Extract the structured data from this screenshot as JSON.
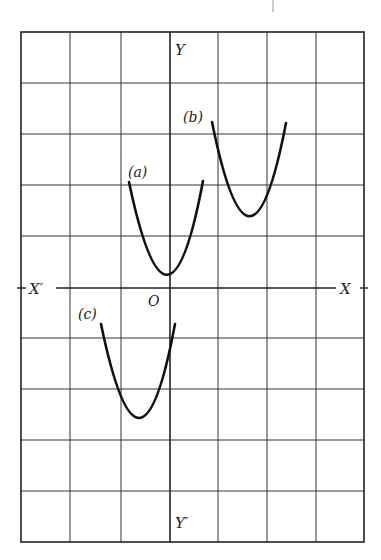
{
  "diagram": {
    "type": "coordinate-grid-with-parabolas",
    "grid": {
      "columns": 7,
      "rows": 10,
      "origin_col": 3,
      "origin_row": 5
    },
    "axes": {
      "x_positive": "X",
      "x_negative": "X′",
      "y_positive": "Y",
      "y_negative": "Y′",
      "origin": "O"
    },
    "curves": [
      {
        "id": "a",
        "label": "(a)",
        "vertex": [
          0,
          0.3
        ],
        "shape": "parabola-up"
      },
      {
        "id": "b",
        "label": "(b)",
        "vertex": [
          1.6,
          1.4
        ],
        "shape": "parabola-up"
      },
      {
        "id": "c",
        "label": "(c)",
        "vertex": [
          -0.6,
          -2.6
        ],
        "shape": "parabola-up"
      }
    ],
    "colors": {
      "line": "#222222",
      "curve": "#111111",
      "background": "#ffffff"
    }
  }
}
